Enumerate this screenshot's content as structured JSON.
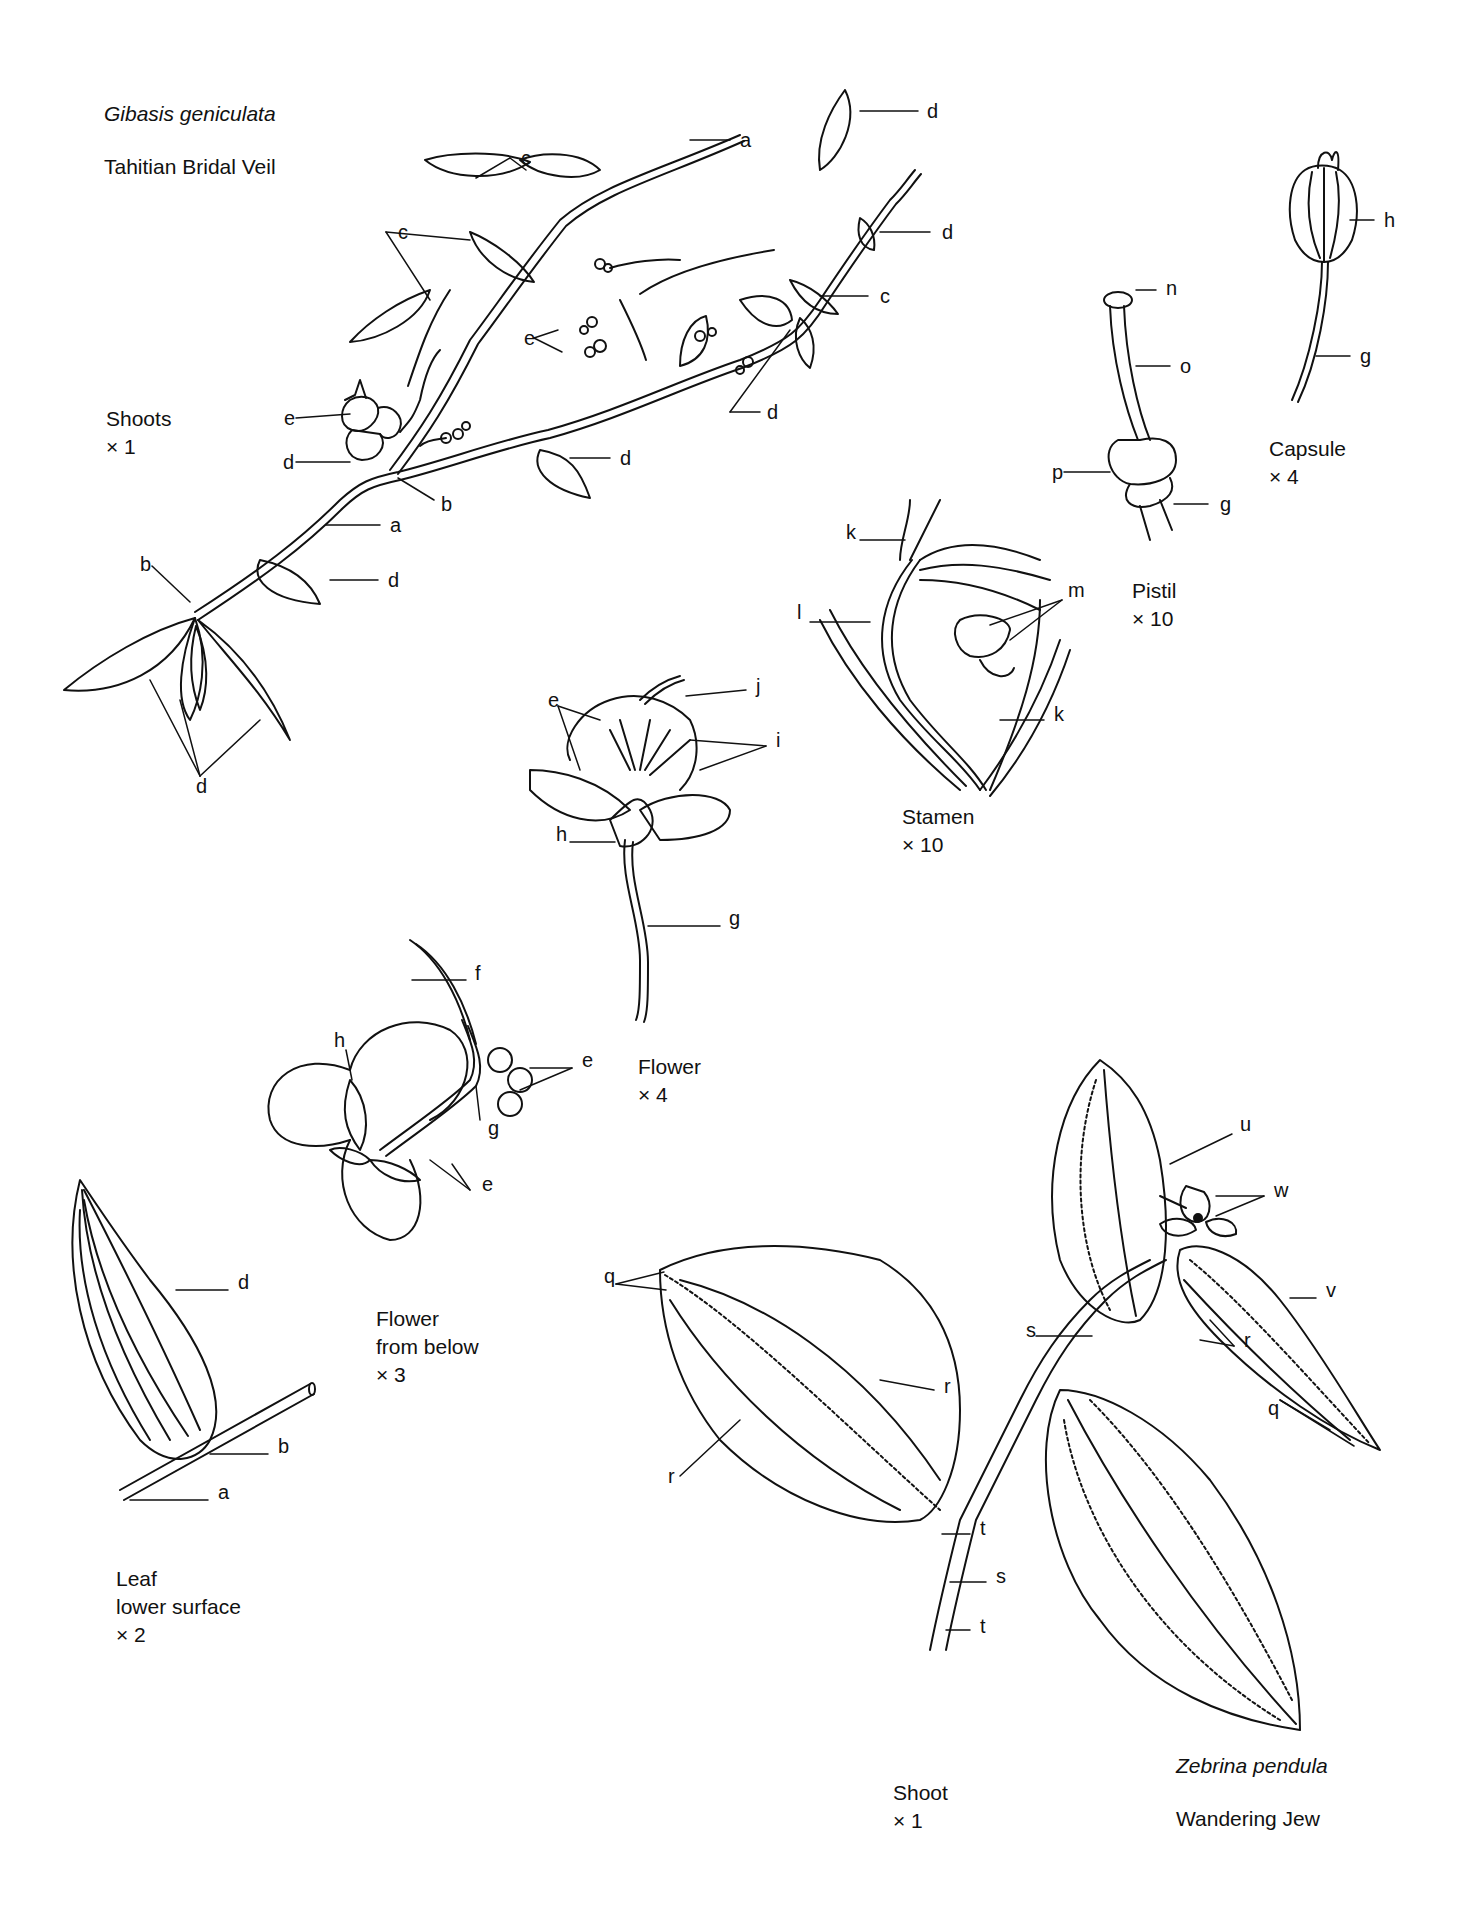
{
  "plate": {
    "species_1": {
      "scientific_name": "Gibasis geniculata",
      "common_name": "Tahitian Bridal Veil"
    },
    "species_2": {
      "scientific_name": "Zebrina pendula",
      "common_name": "Wandering Jew"
    }
  },
  "figures": {
    "shoots": {
      "title": "Shoots",
      "scale": "× 1"
    },
    "capsule": {
      "title": "Capsule",
      "scale": "× 4"
    },
    "pistil": {
      "title": "Pistil",
      "scale": "× 10"
    },
    "stamen": {
      "title": "Stamen",
      "scale": "× 10"
    },
    "flower": {
      "title": "Flower",
      "scale": "× 4"
    },
    "flower_below": {
      "title_1": "Flower",
      "title_2": "from below",
      "scale": "× 3"
    },
    "leaf": {
      "title_1": "Leaf",
      "title_2": "lower surface",
      "scale": "× 2"
    },
    "shoot_zebrina": {
      "title": "Shoot",
      "scale": "× 1"
    }
  },
  "callouts": [
    {
      "letter": "a",
      "x": 740,
      "y": 140
    },
    {
      "letter": "c",
      "x": 521,
      "y": 158
    },
    {
      "letter": "c",
      "x": 398,
      "y": 232
    },
    {
      "letter": "d",
      "x": 927,
      "y": 111
    },
    {
      "letter": "d",
      "x": 942,
      "y": 232
    },
    {
      "letter": "c",
      "x": 880,
      "y": 296
    },
    {
      "letter": "e",
      "x": 524,
      "y": 338
    },
    {
      "letter": "d",
      "x": 767,
      "y": 412
    },
    {
      "letter": "e",
      "x": 284,
      "y": 418
    },
    {
      "letter": "d",
      "x": 283,
      "y": 462
    },
    {
      "letter": "d",
      "x": 620,
      "y": 458
    },
    {
      "letter": "b",
      "x": 441,
      "y": 504
    },
    {
      "letter": "a",
      "x": 390,
      "y": 525
    },
    {
      "letter": "b",
      "x": 140,
      "y": 564
    },
    {
      "letter": "d",
      "x": 388,
      "y": 580
    },
    {
      "letter": "d",
      "x": 196,
      "y": 786
    },
    {
      "letter": "n",
      "x": 1166,
      "y": 288
    },
    {
      "letter": "o",
      "x": 1180,
      "y": 366
    },
    {
      "letter": "p",
      "x": 1052,
      "y": 472
    },
    {
      "letter": "g",
      "x": 1220,
      "y": 504
    },
    {
      "letter": "h",
      "x": 1384,
      "y": 220
    },
    {
      "letter": "g",
      "x": 1360,
      "y": 356
    },
    {
      "letter": "k",
      "x": 846,
      "y": 532
    },
    {
      "letter": "m",
      "x": 1068,
      "y": 590
    },
    {
      "letter": "l",
      "x": 797,
      "y": 612
    },
    {
      "letter": "k",
      "x": 1054,
      "y": 714
    },
    {
      "letter": "j",
      "x": 756,
      "y": 686
    },
    {
      "letter": "e",
      "x": 548,
      "y": 700
    },
    {
      "letter": "i",
      "x": 776,
      "y": 740
    },
    {
      "letter": "h",
      "x": 556,
      "y": 834
    },
    {
      "letter": "g",
      "x": 729,
      "y": 918
    },
    {
      "letter": "f",
      "x": 475,
      "y": 973
    },
    {
      "letter": "h",
      "x": 334,
      "y": 1040
    },
    {
      "letter": "e",
      "x": 582,
      "y": 1060
    },
    {
      "letter": "g",
      "x": 488,
      "y": 1128
    },
    {
      "letter": "e",
      "x": 482,
      "y": 1184
    },
    {
      "letter": "d",
      "x": 238,
      "y": 1282
    },
    {
      "letter": "b",
      "x": 278,
      "y": 1446
    },
    {
      "letter": "a",
      "x": 218,
      "y": 1492
    },
    {
      "letter": "u",
      "x": 1240,
      "y": 1124
    },
    {
      "letter": "w",
      "x": 1274,
      "y": 1190
    },
    {
      "letter": "q",
      "x": 604,
      "y": 1276
    },
    {
      "letter": "v",
      "x": 1326,
      "y": 1290
    },
    {
      "letter": "s",
      "x": 1026,
      "y": 1330
    },
    {
      "letter": "r",
      "x": 944,
      "y": 1386
    },
    {
      "letter": "r",
      "x": 1244,
      "y": 1340
    },
    {
      "letter": "q",
      "x": 1268,
      "y": 1408
    },
    {
      "letter": "r",
      "x": 668,
      "y": 1476
    },
    {
      "letter": "t",
      "x": 980,
      "y": 1528
    },
    {
      "letter": "s",
      "x": 996,
      "y": 1576
    },
    {
      "letter": "t",
      "x": 980,
      "y": 1626
    }
  ]
}
